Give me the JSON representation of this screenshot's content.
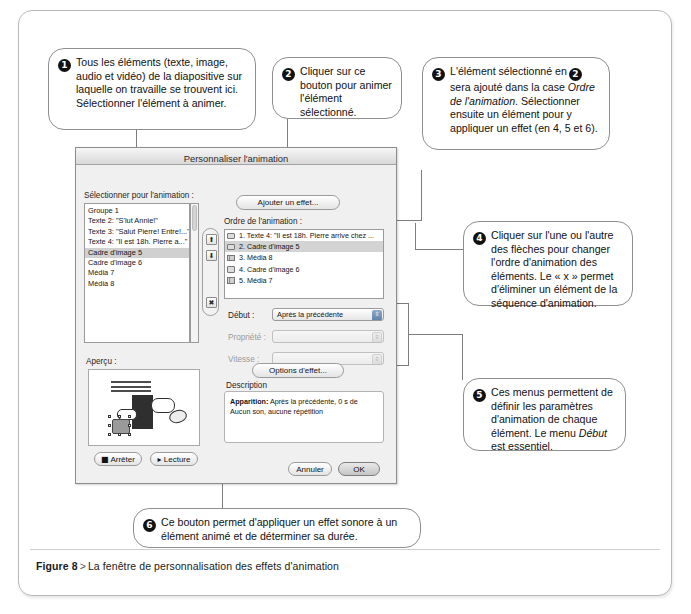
{
  "figure": {
    "label": "Figure 8",
    "separator": ">",
    "caption": "La fenêtre de personnalisation des effets d'animation"
  },
  "callouts": [
    {
      "number": "1",
      "text": "Tous les éléments (texte, image, audio et vidéo) de la diapositive sur laquelle on travaille se trouvent ici. Sélectionner l'élément à animer."
    },
    {
      "number": "2",
      "text": "Cliquer sur ce bouton pour animer l'élément sélectionné."
    },
    {
      "number": "3",
      "part1": "L'élément sélectionné en",
      "inline_badge": "2",
      "part2": "sera ajouté dans la case ",
      "italic1": "Ordre de l'animation",
      "part3": ". Sélectionner ensuite un élément pour y appliquer un effet (en 4, 5 et 6)."
    },
    {
      "number": "4",
      "text": "Cliquer sur l'une ou l'autre des flèches pour changer l'ordre d'animation des éléments. Le « x » permet d'éliminer un élément de la séquence d'animation."
    },
    {
      "number": "5",
      "part1": "Ces menus permettent de définir les paramètres d'animation de chaque élément. Le menu ",
      "italic1": "Début",
      "part2": " est essentiel."
    },
    {
      "number": "6",
      "text": "Ce bouton permet d'appliquer un effet sonore à un élément animé et de déterminer sa durée."
    }
  ],
  "window": {
    "title": "Personnaliser l'animation",
    "select_label": "Sélectionner pour l'animation :",
    "add_effect_button": "Ajouter un effet...",
    "order_label": "Ordre de l'animation :",
    "elements": [
      {
        "label": "Groupe 1",
        "selected": false
      },
      {
        "label": "Texte 2: \"S'lut Annie!\"",
        "selected": false
      },
      {
        "label": "Texte 3: \"Salut Pierre! Entre!...\"",
        "selected": false
      },
      {
        "label": "Texte 4: \"Il est 18h. Pierre a...\"",
        "selected": false
      },
      {
        "label": "Cadre d'image 5",
        "selected": true
      },
      {
        "label": "Cadre d'image 6",
        "selected": false
      },
      {
        "label": "Média 7",
        "selected": false
      },
      {
        "label": "Média 8",
        "selected": false
      }
    ],
    "order_items": [
      {
        "label": "1. Texte 4: \"Il est 18h. Pierre arrive chez ...",
        "icon": "star-icon",
        "selected": false
      },
      {
        "label": "2. Cadre d'image 5",
        "icon": "star-icon",
        "selected": true
      },
      {
        "label": "3. Média 8",
        "icon": "film-icon",
        "selected": false
      },
      {
        "label": "4. Cadre d'image 6",
        "icon": "star-icon",
        "selected": false
      },
      {
        "label": "5. Média 7",
        "icon": "film-icon",
        "selected": false
      }
    ],
    "reorder_buttons": {
      "up": "⬆",
      "down": "⬇",
      "delete": "✖"
    },
    "fields": [
      {
        "label": "Début :",
        "value": "Après la précédente",
        "enabled": true
      },
      {
        "label": "Propriété :",
        "value": "",
        "enabled": false
      },
      {
        "label": "Vitesse :",
        "value": "",
        "enabled": false
      }
    ],
    "effect_options_button": "Options d'effet...",
    "description_label": "Description",
    "description": {
      "bold": "Apparition:",
      "line1": "Après la précédente, 0 s de",
      "line2": "Aucun son, aucune répétition"
    },
    "preview_label": "Aperçu :",
    "stop_button": "Arrêter",
    "play_button": "Lecture",
    "cancel_button": "Annuler",
    "ok_button": "OK"
  },
  "colors": {
    "frame_border": "#b9b9b9",
    "callout_border": "#8e8e8e",
    "badge_bg": "#111111",
    "window_bg": "#f0f0f0",
    "selection": "#d0d0d0",
    "connector": "#7d7d7d"
  }
}
